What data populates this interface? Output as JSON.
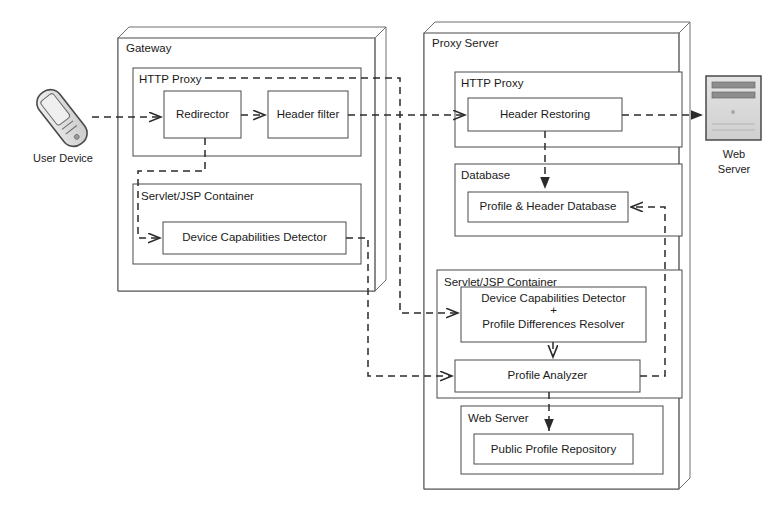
{
  "diagram": {
    "type": "architecture-block-diagram",
    "stroke_color": "#3b3b3b",
    "dashed_color": "#2b2b2b",
    "text_color": "#1a1a1a",
    "background": "#ffffff",
    "device_icon_color": "#d9d9d9",
    "server_icon_color": "#d4d4d4"
  },
  "endpoints": {
    "user_device": {
      "label_line1": "User Device",
      "icon": "mobile-phone-icon"
    },
    "web_server": {
      "label_line1": "Web",
      "label_line2": "Server",
      "icon": "server-rack-icon"
    }
  },
  "gateway": {
    "title": "Gateway",
    "http_proxy": {
      "title": "HTTP Proxy",
      "boxes": [
        {
          "label": "Redirector"
        },
        {
          "label": "Header filter"
        }
      ]
    },
    "servlet_container": {
      "title": "Servlet/JSP Container",
      "boxes": [
        {
          "label": "Device Capabilities Detector"
        }
      ]
    }
  },
  "proxy_server": {
    "title": "Proxy Server",
    "http_proxy": {
      "title": "HTTP Proxy",
      "boxes": [
        {
          "label": "Header Restoring"
        }
      ]
    },
    "database": {
      "title": "Database",
      "boxes": [
        {
          "label": "Profile & Header Database"
        }
      ]
    },
    "servlet_container": {
      "title": "Servlet/JSP Container",
      "boxes": [
        {
          "label_line1": "Device Capabilities Detector",
          "label_line2": "+",
          "label_line3": "Profile Differences Resolver"
        },
        {
          "label": "Profile Analyzer"
        }
      ]
    },
    "web_server_block": {
      "title": "Web Server",
      "boxes": [
        {
          "label": "Public Profile Repository"
        }
      ]
    }
  }
}
